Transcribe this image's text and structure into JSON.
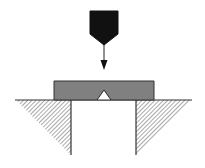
{
  "diagram": {
    "type": "charpy-impact-test",
    "colors": {
      "background": "#ffffff",
      "striker": "#111111",
      "specimen_fill": "#808080",
      "outline": "#333333",
      "hatch": "#7a7a7a",
      "arrow": "#222222"
    },
    "elements": [
      {
        "name": "striker",
        "description": "Pendulum striker / hammer tip"
      },
      {
        "name": "impact-arrow",
        "description": "Direction of impact, downward"
      },
      {
        "name": "specimen",
        "description": "Notched test specimen bar"
      },
      {
        "name": "v-notch",
        "description": "V-notch on underside of specimen, centered between supports"
      },
      {
        "name": "left-anvil",
        "description": "Left support with hatched section"
      },
      {
        "name": "right-anvil",
        "description": "Right support with hatched section"
      }
    ]
  }
}
